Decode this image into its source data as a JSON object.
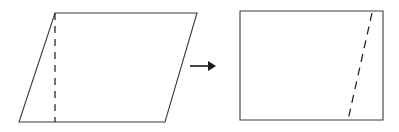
{
  "figure": {
    "background_color": "#ffffff",
    "width": 399,
    "height": 132,
    "outline_color": "#3c3c3c",
    "dash_color": "#222222",
    "arrow_color": "#1a1a1a"
  },
  "shapes": {
    "parallelogram": {
      "name": "parallelogram",
      "points": "55,13 197,13 165,122 19,122",
      "vertices": [
        {
          "label": "top-left",
          "x": 55,
          "y": 13
        },
        {
          "label": "top-right",
          "x": 197,
          "y": 13
        },
        {
          "label": "bottom-right",
          "x": 165,
          "y": 122
        },
        {
          "label": "bottom-left",
          "x": 19,
          "y": 122
        }
      ],
      "cut_line": {
        "name": "vertical-dashed-cut",
        "x1": 55,
        "y1": 13,
        "x2": 55,
        "y2": 122,
        "dash_pattern": "7 6"
      }
    },
    "rectangle": {
      "name": "rectangle",
      "points": "240,11 383,11 383,120 240,120",
      "vertices": [
        {
          "label": "top-left",
          "x": 240,
          "y": 11
        },
        {
          "label": "top-right",
          "x": 383,
          "y": 11
        },
        {
          "label": "bottom-right",
          "x": 383,
          "y": 120
        },
        {
          "label": "bottom-left",
          "x": 240,
          "y": 120
        }
      ],
      "cut_line": {
        "name": "slanted-dashed-cut",
        "x1": 372,
        "y1": 13,
        "x2": 348,
        "y2": 120,
        "dash_pattern": "8 6"
      }
    }
  },
  "arrow": {
    "name": "transformation-arrow",
    "direction": "right",
    "x1": 190,
    "y1": 66,
    "x2": 209,
    "y2": 66,
    "head_points": "208,61 216,66 208,71"
  }
}
